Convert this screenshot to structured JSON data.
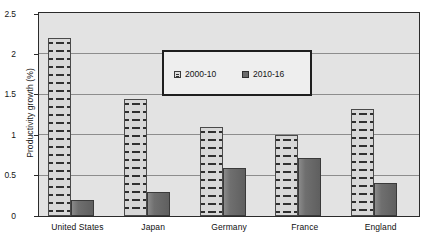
{
  "chart_data": {
    "type": "bar",
    "title": "",
    "xlabel": "",
    "ylabel": "Productivity growth (%)",
    "ylim": [
      0,
      2.5
    ],
    "grid": true,
    "legend_position": "top-center-inside",
    "categories": [
      "United States",
      "Japan",
      "Germany",
      "France",
      "England"
    ],
    "yticks": [
      "0",
      "0.5",
      "1",
      "1.5",
      "2",
      "2.5"
    ],
    "ytick_values": [
      0,
      0.5,
      1,
      1.5,
      2,
      2.5
    ],
    "series": [
      {
        "name": "2000-10",
        "values": [
          2.2,
          1.45,
          1.1,
          1.0,
          1.32
        ],
        "pattern": "dashed-brick-hatch",
        "color": "#d7d7d7"
      },
      {
        "name": "2010-16",
        "values": [
          0.2,
          0.3,
          0.6,
          0.72,
          0.41
        ],
        "pattern": "solid",
        "color": "#6b6b6b"
      }
    ]
  },
  "legend": {
    "items": [
      {
        "label": "2000-10",
        "swatch": "legend-swatch-hatched"
      },
      {
        "label": "2010-16",
        "swatch": "legend-swatch-solid"
      }
    ]
  },
  "axes": {
    "y_title": "Productivity growth (%)"
  },
  "caption": {
    "partial_text": ""
  },
  "colors": {
    "plot_background": "#e3e3e3",
    "plot_border": "#2b2b2b",
    "gridline": "#8d8d8d",
    "series_a_fill": "#d7d7d7",
    "series_a_hatch": "#2f2f2f",
    "series_b_fill": "#6b6b6b",
    "legend_background": "#eeeeee",
    "legend_border": "#1e1e1e",
    "text": "#141414"
  }
}
